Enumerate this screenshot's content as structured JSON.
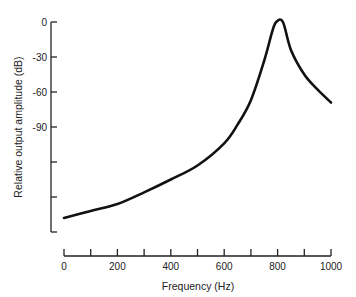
{
  "chart_data": {
    "type": "line",
    "title": "",
    "xlabel": "Frequency (Hz)",
    "ylabel": "Relative output amplitude (dB)",
    "xlim": [
      0,
      1000
    ],
    "ylim": [
      -180,
      0
    ],
    "grid": false,
    "legend": null,
    "x_ticks": [
      0,
      100,
      200,
      300,
      400,
      500,
      600,
      700,
      800,
      900,
      1000
    ],
    "x_tick_labels": [
      "0",
      "",
      "200",
      "",
      "400",
      "",
      "600",
      "",
      "800",
      "",
      "1000"
    ],
    "y_ticks": [
      0,
      -30,
      -60,
      -90,
      -120,
      -150,
      -180
    ],
    "y_tick_labels": [
      "0",
      "-30",
      "-60",
      "-90",
      "",
      "",
      ""
    ],
    "series": [
      {
        "name": "Resonance response",
        "x": [
          0,
          100,
          200,
          300,
          400,
          500,
          600,
          650,
          700,
          750,
          780,
          795,
          820,
          850,
          900,
          950,
          1000
        ],
        "y": [
          -168,
          -162,
          -156,
          -146,
          -135,
          -123,
          -104,
          -88,
          -67,
          -33,
          -8,
          0,
          0,
          -24,
          -45,
          -58,
          -69
        ]
      }
    ]
  }
}
